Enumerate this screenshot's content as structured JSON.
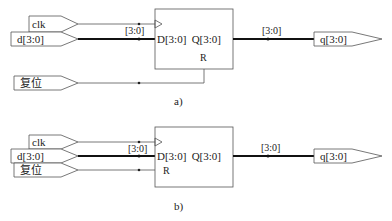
{
  "diagram_a": {
    "caption": "a)",
    "inputs": [
      {
        "label": "clk"
      },
      {
        "label": "d[3:0]"
      },
      {
        "label": "复位"
      }
    ],
    "bus_label_in": "[3:0]",
    "register": {
      "d_port": "D[3:0]",
      "q_port": "Q[3:0]",
      "reset_port": "R"
    },
    "bus_label_out": "[3:0]",
    "output": {
      "label": "q[3:0]"
    }
  },
  "diagram_b": {
    "caption": "b)",
    "inputs": [
      {
        "label": "clk"
      },
      {
        "label": "d[3:0]"
      },
      {
        "label": "复位"
      }
    ],
    "bus_label_in": "[3:0]",
    "register": {
      "d_port": "D[3:0]",
      "q_port": "Q[3:0]",
      "reset_port": "R"
    },
    "bus_label_out": "[3:0]",
    "output": {
      "label": "q[3:0]"
    }
  },
  "colors": {
    "line": "#444444",
    "bus": "#111111"
  }
}
